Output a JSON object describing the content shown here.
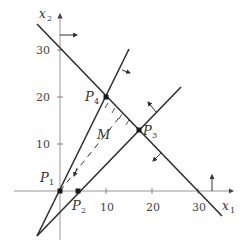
{
  "diagram": {
    "type": "linear-programming-feasible-region",
    "axes": {
      "x_label": "x",
      "x_sub": "1",
      "y_label": "x",
      "y_sub": "2",
      "x_ticks": [
        "10",
        "20",
        "30"
      ],
      "y_ticks": [
        "10",
        "20",
        "30"
      ]
    },
    "points": [
      {
        "name": "P",
        "sub": "1",
        "x": 0,
        "y": 0
      },
      {
        "name": "P",
        "sub": "2",
        "x": 4,
        "y": 0
      },
      {
        "name": "P",
        "sub": "3",
        "x": 17,
        "y": 13
      },
      {
        "name": "P",
        "sub": "4",
        "x": 10,
        "y": 20
      }
    ],
    "region_label": "M",
    "colors": {
      "line": "#2a2a2a",
      "axis": "#8a8a8a",
      "point": "#1a1a1a"
    }
  }
}
